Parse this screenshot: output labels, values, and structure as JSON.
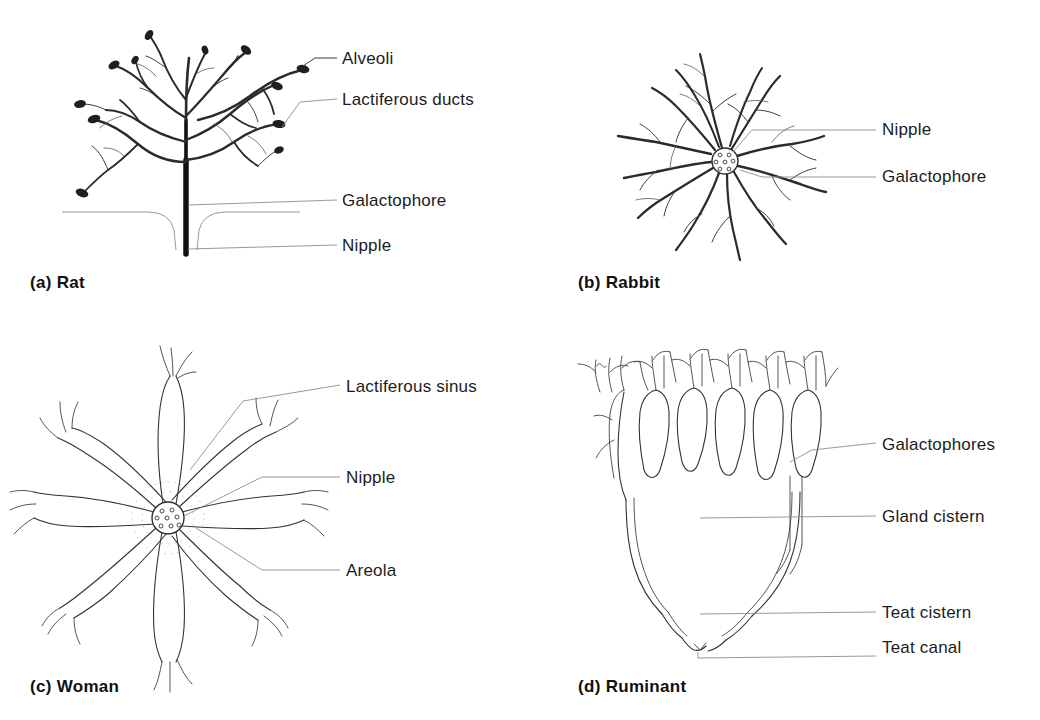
{
  "figure": {
    "background_color": "#ffffff",
    "ink_color": "#1f1f1f",
    "leader_color": "#3a3a3a"
  },
  "panels": [
    {
      "id": "a",
      "caption_marker": "(a)",
      "caption_name": "Rat",
      "caption_full": "(a)  Rat",
      "labels": [
        {
          "key": "alveoli",
          "text": "Alveoli"
        },
        {
          "key": "lactiferous-ducts",
          "text": "Lactiferous ducts"
        },
        {
          "key": "galactophore",
          "text": "Galactophore"
        },
        {
          "key": "nipple",
          "text": "Nipple"
        }
      ]
    },
    {
      "id": "b",
      "caption_marker": "(b)",
      "caption_name": "Rabbit",
      "caption_full": "(b)  Rabbit",
      "labels": [
        {
          "key": "nipple",
          "text": "Nipple"
        },
        {
          "key": "galactophore",
          "text": "Galactophore"
        }
      ]
    },
    {
      "id": "c",
      "caption_marker": "(c)",
      "caption_name": "Woman",
      "caption_full": "(c)  Woman",
      "labels": [
        {
          "key": "lactiferous-sinus",
          "text": "Lactiferous sinus"
        },
        {
          "key": "nipple",
          "text": "Nipple"
        },
        {
          "key": "areola",
          "text": "Areola"
        }
      ]
    },
    {
      "id": "d",
      "caption_marker": "(d)",
      "caption_name": "Ruminant",
      "caption_full": "(d)  Ruminant",
      "labels": [
        {
          "key": "galactophores",
          "text": "Galactophores"
        },
        {
          "key": "gland-cistern",
          "text": "Gland cistern"
        },
        {
          "key": "teat-cistern",
          "text": "Teat cistern"
        },
        {
          "key": "teat-canal",
          "text": "Teat canal"
        }
      ]
    }
  ],
  "diagram_data": {
    "type": "labeled-anatomical-diagram",
    "panel_count": 4,
    "layout": "2x2 grid",
    "species": [
      "Rat",
      "Rabbit",
      "Woman",
      "Ruminant"
    ],
    "structures_labeled": [
      "Alveoli",
      "Lactiferous ducts",
      "Galactophore",
      "Nipple",
      "Galactophore",
      "Lactiferous sinus",
      "Areola",
      "Galactophores",
      "Gland cistern",
      "Teat cistern",
      "Teat canal"
    ]
  }
}
